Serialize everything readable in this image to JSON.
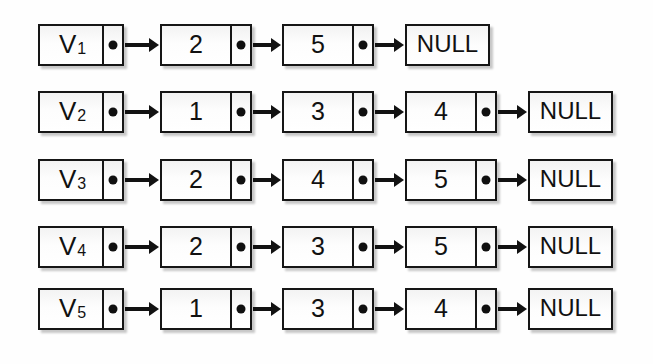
{
  "figure": {
    "kind": "linked-list-diagram",
    "background_color": "#ffffff",
    "stroke_color": "#161616",
    "fill_color": "#fcfcfc",
    "terminator_label": "NULL",
    "rows": [
      {
        "head_label": "V",
        "head_subscript": "1",
        "values": [
          "2",
          "5"
        ],
        "terminator": "NULL"
      },
      {
        "head_label": "V",
        "head_subscript": "2",
        "values": [
          "1",
          "3",
          "4"
        ],
        "terminator": "NULL"
      },
      {
        "head_label": "V",
        "head_subscript": "3",
        "values": [
          "2",
          "4",
          "5"
        ],
        "terminator": "NULL"
      },
      {
        "head_label": "V",
        "head_subscript": "4",
        "values": [
          "2",
          "3",
          "5"
        ],
        "terminator": "NULL"
      },
      {
        "head_label": "V",
        "head_subscript": "5",
        "values": [
          "1",
          "3",
          "4"
        ],
        "terminator": "NULL"
      }
    ]
  },
  "layout": {
    "row_tops": [
      24,
      91,
      159,
      226,
      288
    ],
    "head_x": 38,
    "head_width": 86,
    "node_xs": [
      160,
      282,
      405
    ],
    "node_width": 92,
    "null_xs_by_row": [
      405,
      528,
      528,
      528,
      528
    ],
    "null_width": 85
  }
}
